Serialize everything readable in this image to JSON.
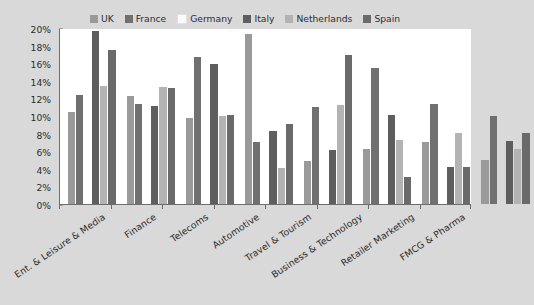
{
  "chart_data": {
    "type": "bar",
    "title": "",
    "xlabel": "",
    "ylabel": "",
    "ylim": [
      0,
      20
    ],
    "ytick_labels": [
      "20%",
      "18%",
      "16%",
      "14%",
      "12%",
      "10%",
      "8%",
      "6%",
      "4%",
      "2%",
      "0%"
    ],
    "ytick_values": [
      20,
      18,
      16,
      14,
      12,
      10,
      8,
      6,
      4,
      2,
      0
    ],
    "grid": false,
    "legend_position": "top-center",
    "categories": [
      "Ent. & Leisure & Media",
      "Finance",
      "Telecoms",
      "Automotive",
      "Travel & Tourism",
      "Business & Technology",
      "Retailer Marketing",
      "FMCG & Pharma"
    ],
    "series": [
      {
        "name": "UK",
        "color": "#9a9a9a",
        "values": [
          10.4,
          12.3,
          9.8,
          19.3,
          4.9,
          6.2,
          7.1,
          5.0
        ]
      },
      {
        "name": "France",
        "color": "#707070",
        "values": [
          12.4,
          11.4,
          16.7,
          7.0,
          11.0,
          15.4,
          11.4,
          10.0
        ]
      },
      {
        "name": "Germany",
        "color": "#fbfbfb",
        "values": [
          0,
          0,
          0,
          0,
          0,
          0,
          0,
          0
        ]
      },
      {
        "name": "Italy",
        "color": "#5e5e5e",
        "values": [
          19.7,
          11.1,
          15.9,
          8.3,
          6.1,
          10.1,
          4.2,
          7.2
        ]
      },
      {
        "name": "Netherlands",
        "color": "#b3b3b3",
        "values": [
          13.4,
          13.3,
          10.0,
          4.1,
          11.2,
          7.3,
          8.1,
          6.3
        ]
      },
      {
        "name": "Spain",
        "color": "#6a6a6a",
        "values": [
          17.5,
          13.2,
          10.1,
          9.1,
          16.9,
          3.1,
          4.2,
          8.1
        ]
      }
    ]
  },
  "colors": {
    "background": "#d9d9d9",
    "plot_background": "#ffffff",
    "axis": "#6d6d6d",
    "text": "#2b2b2b"
  }
}
